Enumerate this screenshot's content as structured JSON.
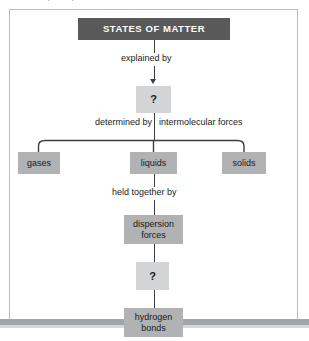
{
  "page": {
    "partial_text_top": "concept map of the states of matter",
    "frame_label": "states-of-matter-concept-map"
  },
  "diagram": {
    "type": "concept-map",
    "title_node": {
      "id": "states-of-matter",
      "label": "STATES OF MATTER",
      "style": "dark"
    },
    "nodes": [
      {
        "id": "unknown-top",
        "label": "?",
        "style": "light"
      },
      {
        "id": "gases",
        "label": "gases",
        "style": "mid"
      },
      {
        "id": "liquids",
        "label": "liquids",
        "style": "mid"
      },
      {
        "id": "solids",
        "label": "solids",
        "style": "mid"
      },
      {
        "id": "dispersion-forces",
        "label": "dispersion\nforces",
        "style": "mid"
      },
      {
        "id": "unknown-bottom",
        "label": "?",
        "style": "light"
      },
      {
        "id": "hydrogen-bonds",
        "label": "hydrogen\nbonds",
        "style": "mid"
      }
    ],
    "edge_labels": [
      {
        "id": "explained-by",
        "label": "explained by"
      },
      {
        "id": "determined-by",
        "label": "determined by"
      },
      {
        "id": "intermolecular-forces",
        "label": "intermolecular forces"
      },
      {
        "id": "held-together-by",
        "label": "held together by"
      }
    ],
    "node_text": {
      "title": "STATES OF MATTER",
      "unknown_top": "?",
      "gases": "gases",
      "liquids": "liquids",
      "solids": "solids",
      "dispersion_line1": "dispersion",
      "dispersion_line2": "forces",
      "unknown_bottom": "?",
      "hydrogen_line1": "hydrogen",
      "hydrogen_line2": "bonds"
    },
    "labels": {
      "explained_by": "explained by",
      "determined_by": "determined by",
      "intermolecular_forces": "intermolecular forces",
      "held_together_by": "held together by"
    },
    "colors": {
      "title_fill": "#595959",
      "title_text": "#ffffff",
      "node_fill": "#b0b2b4",
      "unknown_fill": "#d2d4d5",
      "line": "#3d3d3d",
      "frame_border": "#b9bcbe",
      "page_bg": "#ffffff",
      "bottom_bar": "#a3a6a8"
    }
  }
}
